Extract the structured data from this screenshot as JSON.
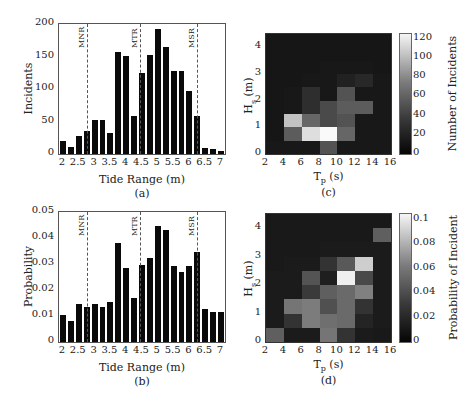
{
  "chart_data": [
    {
      "id": "a",
      "type": "bar",
      "caption": "(a)",
      "xlabel": "Tide Range (m)",
      "ylabel": "Incidents",
      "xlim": [
        1.875,
        7.125
      ],
      "ylim": [
        0,
        200
      ],
      "xticks": [
        "2",
        "2.5",
        "3",
        "3.5",
        "4",
        "4.5",
        "5",
        "5.5",
        "6",
        "6.5",
        "7"
      ],
      "yticks": [
        "0",
        "50",
        "100",
        "150",
        "200"
      ],
      "bin_width": 0.25,
      "x": [
        2.0,
        2.25,
        2.5,
        2.75,
        3.0,
        3.25,
        3.5,
        3.75,
        4.0,
        4.25,
        4.5,
        4.75,
        5.0,
        5.25,
        5.5,
        5.75,
        6.0,
        6.25,
        6.5,
        6.75,
        7.0
      ],
      "values": [
        20,
        11,
        27,
        35,
        53,
        53,
        32,
        157,
        151,
        59,
        125,
        153,
        192,
        164,
        128,
        127,
        97,
        59,
        9,
        7,
        5
      ],
      "reference_lines": [
        {
          "label": "MNR",
          "x": 2.75
        },
        {
          "label": "MTR",
          "x": 4.45
        },
        {
          "label": "MSR",
          "x": 6.25
        }
      ],
      "grid": false
    },
    {
      "id": "b",
      "type": "bar",
      "caption": "(b)",
      "xlabel": "Tide Range (m)",
      "ylabel": "Probability",
      "xlim": [
        1.875,
        7.125
      ],
      "ylim": [
        0,
        0.05
      ],
      "xticks": [
        "2",
        "2.5",
        "3",
        "3.5",
        "4",
        "4.5",
        "5",
        "5.5",
        "6",
        "6.5",
        "7"
      ],
      "yticks": [
        "0",
        "0.01",
        "0.02",
        "0.03",
        "0.04",
        "0.05"
      ],
      "bin_width": 0.25,
      "x": [
        2.0,
        2.25,
        2.5,
        2.75,
        3.0,
        3.25,
        3.5,
        3.75,
        4.0,
        4.25,
        4.5,
        4.75,
        5.0,
        5.25,
        5.5,
        5.75,
        6.0,
        6.25,
        6.5,
        6.75,
        7.0
      ],
      "values": [
        0.0105,
        0.0082,
        0.0145,
        0.0134,
        0.0146,
        0.0135,
        0.0152,
        0.0381,
        0.0286,
        0.0168,
        0.0295,
        0.0323,
        0.0447,
        0.0431,
        0.0292,
        0.0268,
        0.0292,
        0.0347,
        0.0126,
        0.0114,
        0.0115
      ],
      "reference_lines": [
        {
          "label": "MNR",
          "x": 2.75
        },
        {
          "label": "MTR",
          "x": 4.45
        },
        {
          "label": "MSR",
          "x": 6.25
        }
      ],
      "grid": false
    },
    {
      "id": "c",
      "type": "heatmap",
      "caption": "(c)",
      "xlabel": "T",
      "xlabel_sub": "p",
      "xlabel_unit": " (s)",
      "ylabel": "H",
      "ylabel_sub": "s",
      "ylabel_unit": " (m)",
      "colorbar_label": "Number of Incidents",
      "colorbar_ticks": [
        "0",
        "20",
        "40",
        "60",
        "80",
        "100",
        "120"
      ],
      "clim": [
        0,
        125
      ],
      "xlim": [
        2,
        16
      ],
      "ylim": [
        0,
        4.5
      ],
      "xticks": [
        "2",
        "4",
        "6",
        "8",
        "10",
        "12",
        "14",
        "16"
      ],
      "yticks": [
        "0",
        "1",
        "2",
        "3",
        "4"
      ],
      "x_edges": [
        2,
        4,
        6,
        8,
        10,
        12,
        14,
        16
      ],
      "y_edges": [
        0,
        0.5,
        1,
        1.5,
        2,
        2.5,
        3,
        3.5,
        4,
        4.5
      ],
      "z_rows_bottom_to_top": [
        [
          3,
          3,
          3,
          35,
          3,
          3,
          3
        ],
        [
          2,
          40,
          110,
          125,
          45,
          3,
          3
        ],
        [
          2,
          95,
          45,
          30,
          35,
          3,
          3
        ],
        [
          2,
          3,
          15,
          30,
          40,
          40,
          3
        ],
        [
          2,
          3,
          15,
          3,
          35,
          3,
          3
        ],
        [
          2,
          2,
          3,
          3,
          8,
          12,
          3
        ],
        [
          2,
          2,
          2,
          3,
          3,
          3,
          2
        ],
        [
          2,
          2,
          2,
          2,
          2,
          2,
          2
        ],
        [
          2,
          2,
          2,
          2,
          2,
          2,
          2
        ]
      ]
    },
    {
      "id": "d",
      "type": "heatmap",
      "caption": "(d)",
      "xlabel": "T",
      "xlabel_sub": "p",
      "xlabel_unit": " (s)",
      "ylabel": "H",
      "ylabel_sub": "s",
      "ylabel_unit": " (m)",
      "colorbar_label": "Probability of Incident",
      "colorbar_ticks": [
        "0",
        "0.02",
        "0.04",
        "0.06",
        "0.08",
        "0.1"
      ],
      "clim": [
        0,
        0.105
      ],
      "xlim": [
        2,
        16
      ],
      "ylim": [
        0,
        4.5
      ],
      "xticks": [
        "2",
        "4",
        "6",
        "8",
        "10",
        "12",
        "14",
        "16"
      ],
      "yticks": [
        "0",
        "1",
        "2",
        "3",
        "4"
      ],
      "x_edges": [
        2,
        4,
        6,
        8,
        10,
        12,
        14,
        16
      ],
      "y_edges": [
        0,
        0.5,
        1,
        1.5,
        2,
        2.5,
        3,
        3.5,
        4,
        4.5
      ],
      "z_rows_bottom_to_top": [
        [
          0.035,
          0.004,
          0.004,
          0.045,
          0.015,
          0.004,
          0.003
        ],
        [
          0.004,
          0.015,
          0.048,
          0.042,
          0.04,
          0.008,
          0.004
        ],
        [
          0.004,
          0.045,
          0.048,
          0.028,
          0.04,
          0.015,
          0.004
        ],
        [
          0.004,
          0.004,
          0.018,
          0.035,
          0.04,
          0.05,
          0.004
        ],
        [
          0.004,
          0.004,
          0.03,
          0.006,
          0.1,
          0.025,
          0.004
        ],
        [
          0.003,
          0.004,
          0.004,
          0.015,
          0.032,
          0.085,
          0.004
        ],
        [
          0.003,
          0.003,
          0.003,
          0.004,
          0.004,
          0.004,
          0.004
        ],
        [
          0.003,
          0.003,
          0.003,
          0.003,
          0.003,
          0.003,
          0.035
        ],
        [
          0.003,
          0.003,
          0.003,
          0.003,
          0.003,
          0.003,
          0.003
        ]
      ]
    }
  ]
}
